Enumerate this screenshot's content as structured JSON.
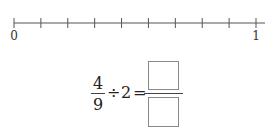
{
  "number_line": {
    "start_label": "0",
    "end_label": "1",
    "divisions": 9,
    "tick_count": 10
  },
  "expression": {
    "fraction_numerator": "4",
    "fraction_denominator": "9",
    "operator": "÷",
    "divisor": "2",
    "equals": "=",
    "answer_numerator_placeholder": "",
    "answer_denominator_placeholder": ""
  },
  "colors": {
    "line": "#555555",
    "box_border": "#8a8a8a",
    "text": "#222222"
  }
}
